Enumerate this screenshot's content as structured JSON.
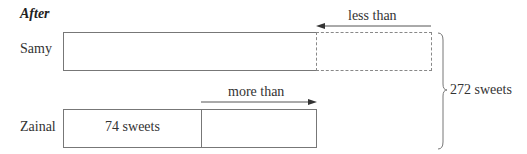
{
  "diagram": {
    "title": "After",
    "rows": [
      {
        "name": "Samy",
        "relation_label": "less than"
      },
      {
        "name": "Zainal",
        "known_part": "74 sweets",
        "relation_label": "more than"
      }
    ],
    "total_label": "272 sweets",
    "colors": {
      "line": "#777777",
      "text": "#333333",
      "dashed": "#888888"
    }
  }
}
